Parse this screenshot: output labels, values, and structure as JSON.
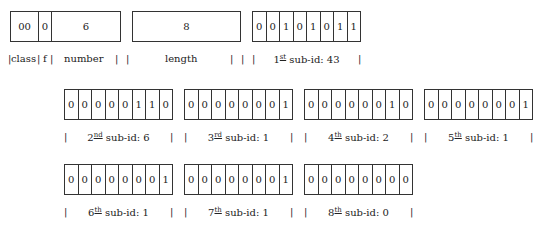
{
  "header": {
    "class_value": "00",
    "f_value": "0",
    "number_value": "6",
    "length_value": "8",
    "labels": {
      "class": "class",
      "f": "f",
      "number": "number",
      "length": "length"
    }
  },
  "sub_ids": [
    {
      "ordinal": "1",
      "suffix": "st",
      "text": "sub-id: 43",
      "bits": [
        "0",
        "0",
        "1",
        "0",
        "1",
        "0",
        "1",
        "1"
      ]
    },
    {
      "ordinal": "2",
      "suffix": "nd",
      "text": "sub-id: 6",
      "bits": [
        "0",
        "0",
        "0",
        "0",
        "0",
        "1",
        "1",
        "0"
      ]
    },
    {
      "ordinal": "3",
      "suffix": "rd",
      "text": "sub-id: 1",
      "bits": [
        "0",
        "0",
        "0",
        "0",
        "0",
        "0",
        "0",
        "1"
      ]
    },
    {
      "ordinal": "4",
      "suffix": "th",
      "text": "sub-id: 2",
      "bits": [
        "0",
        "0",
        "0",
        "0",
        "0",
        "0",
        "1",
        "0"
      ]
    },
    {
      "ordinal": "5",
      "suffix": "th",
      "text": "sub-id: 1",
      "bits": [
        "0",
        "0",
        "0",
        "0",
        "0",
        "0",
        "0",
        "1"
      ]
    },
    {
      "ordinal": "6",
      "suffix": "th",
      "text": "sub-id: 1",
      "bits": [
        "0",
        "0",
        "0",
        "0",
        "0",
        "0",
        "0",
        "1"
      ]
    },
    {
      "ordinal": "7",
      "suffix": "th",
      "text": "sub-id: 1",
      "bits": [
        "0",
        "0",
        "0",
        "0",
        "0",
        "0",
        "0",
        "1"
      ]
    },
    {
      "ordinal": "8",
      "suffix": "th",
      "text": "sub-id: 0",
      "bits": [
        "0",
        "0",
        "0",
        "0",
        "0",
        "0",
        "0",
        "0"
      ]
    }
  ]
}
